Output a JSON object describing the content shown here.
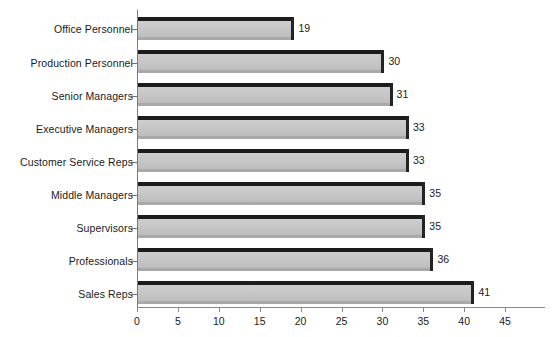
{
  "chart_data": {
    "type": "bar",
    "orientation": "horizontal",
    "title": "",
    "xlabel": "",
    "ylabel": "",
    "xlim": [
      0,
      45
    ],
    "grid": false,
    "legend": null,
    "categories": [
      "Office Personnel",
      "Production Personnel",
      "Senior Managers",
      "Executive Managers",
      "Customer Service Reps",
      "Middle Managers",
      "Supervisors",
      "Professionals",
      "Sales Reps"
    ],
    "values": [
      19,
      30,
      31,
      33,
      33,
      35,
      35,
      36,
      41
    ],
    "value_labels": [
      "19",
      "30",
      "31",
      "33",
      "33",
      "35",
      "35",
      "36",
      "41"
    ],
    "xticks": [
      0,
      5,
      10,
      15,
      20,
      25,
      30,
      35,
      40,
      45
    ],
    "xtick_labels": [
      "0",
      "5",
      "10",
      "15",
      "20",
      "25",
      "30",
      "35",
      "40",
      "45"
    ],
    "colors": {
      "bar_face": "#c6c6c6",
      "bar_edge": "#1c1c1c",
      "axis": "#8a8a8a",
      "text": "#1a1a1a",
      "background": "#ffffff"
    }
  }
}
